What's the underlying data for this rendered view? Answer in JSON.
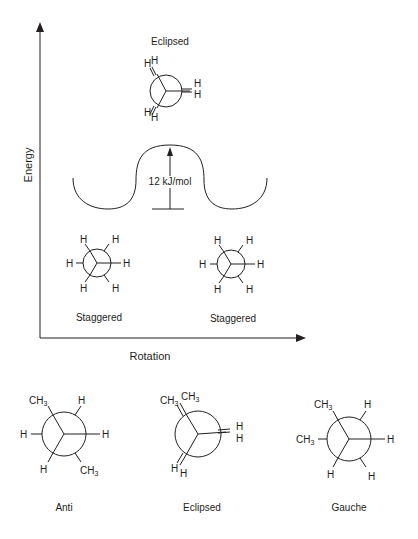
{
  "diagram": {
    "axes": {
      "y_label": "Energy",
      "x_label": "Rotation"
    },
    "energy_plot": {
      "peak_label": "Eclipsed",
      "barrier_label": "12 kJ/mol",
      "left_trough_label": "Staggered",
      "right_trough_label": "Staggered"
    },
    "ethane_eclipsed": {
      "front_atoms": [
        "H",
        "H",
        "H"
      ],
      "back_atoms": [
        "H",
        "H",
        "H"
      ]
    },
    "ethane_staggered_left": {
      "atoms": [
        "H",
        "H",
        "H",
        "H",
        "H",
        "H"
      ]
    },
    "ethane_staggered_right": {
      "atoms": [
        "H",
        "H",
        "H",
        "H",
        "H",
        "H"
      ]
    },
    "butane": [
      {
        "name": "Anti",
        "substituents": [
          "CH3",
          "H",
          "H",
          "H",
          "H",
          "CH3"
        ]
      },
      {
        "name": "Eclipsed",
        "substituents": [
          "CH3",
          "CH3",
          "H",
          "H",
          "H",
          "H"
        ]
      },
      {
        "name": "Gauche",
        "substituents": [
          "CH3",
          "CH3",
          "H",
          "H",
          "H",
          "H"
        ]
      }
    ],
    "atom_labels": {
      "H": "H",
      "C": "CH",
      "sub3": "3"
    },
    "colors": {
      "ink": "#231f20",
      "background": "#ffffff"
    }
  }
}
